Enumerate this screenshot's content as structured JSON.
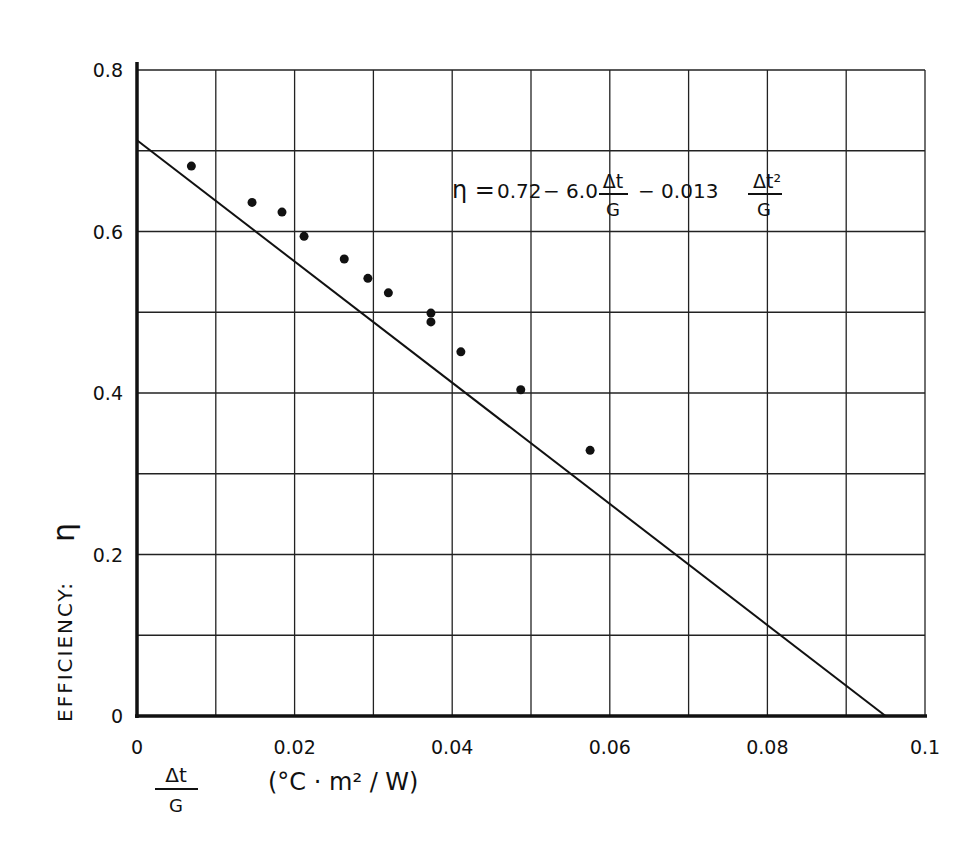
{
  "chart_data": {
    "type": "scatter",
    "title": "",
    "xlabel": "Δt / G  (°C · m² / W)",
    "ylabel": "EFFICIENCY: η",
    "xlabel_parts": {
      "numerator": "Δt",
      "denominator": "G",
      "units": "(°C · m² / W)"
    },
    "ylabel_parts": {
      "text": "EFFICIENCY:",
      "symbol": "η"
    },
    "xlim": [
      0,
      0.1
    ],
    "ylim": [
      0,
      0.8
    ],
    "grid": true,
    "grid_x_step": 0.01,
    "grid_y_step": 0.1,
    "x_ticks": [
      0,
      0.02,
      0.04,
      0.06,
      0.08,
      0.1
    ],
    "x_tick_labels": [
      "0",
      "0.02",
      "0.04",
      "0.06",
      "0.08",
      "0.1"
    ],
    "y_ticks": [
      0,
      0.2,
      0.4,
      0.6,
      0.8
    ],
    "y_tick_labels": [
      "0",
      "0.2",
      "0.4",
      "0.6",
      "0.8"
    ],
    "legend": null,
    "annotation": {
      "text": "η = 0.72 − 6.0 Δt/G − 0.013 Δt²/G",
      "lhs": "η =",
      "c0": "0.72",
      "c1": "− 6.0",
      "c2": "− 0.013",
      "frac1_num": "Δt",
      "frac1_den": "G",
      "frac2_num": "Δt²",
      "frac2_den": "G",
      "position": [
        0.04,
        0.65
      ]
    },
    "series": [
      {
        "name": "measured data",
        "type": "scatter",
        "marker": "filled-circle",
        "x": [
          0.0069,
          0.0146,
          0.0184,
          0.0212,
          0.0263,
          0.0293,
          0.0319,
          0.0373,
          0.0373,
          0.0411,
          0.0487,
          0.0575
        ],
        "y": [
          0.681,
          0.636,
          0.624,
          0.594,
          0.566,
          0.542,
          0.524,
          0.499,
          0.488,
          0.451,
          0.404,
          0.329
        ]
      },
      {
        "name": "fit line",
        "type": "line",
        "x": [
          0,
          0.095
        ],
        "y": [
          0.713,
          0
        ]
      }
    ]
  },
  "colors": {
    "ink": "#111111",
    "grid": "#222222",
    "background": "#ffffff"
  }
}
